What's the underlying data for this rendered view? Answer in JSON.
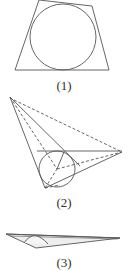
{
  "figures": [
    {
      "id": "1",
      "label": "(1)",
      "description": "Quadrilateral with inscribed circle"
    },
    {
      "id": "2",
      "label": "(2)",
      "description": "Triangular pyramid with inscribed sphere cross-section and dashed hidden edges"
    },
    {
      "id": "3",
      "label": "(3)",
      "description": "Flattened thin wedge with partially visible arc"
    }
  ],
  "colors": {
    "stroke": "#555555",
    "background": "#ffffff",
    "shade": "#e6e6e6"
  }
}
